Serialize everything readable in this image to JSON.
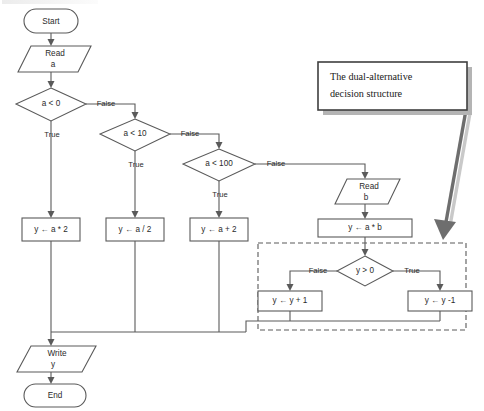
{
  "diagram": {
    "type": "flowchart",
    "title_visible": false,
    "colors": {
      "shape_stroke": "#5a5a5a",
      "shape_fill": "#ffffff",
      "text": "#2b2b2b",
      "callout_border": "#3f3f3f",
      "callout_shadow": "#b4b4b4",
      "pointer_arrow": "#6e6e6e",
      "dashed_region": "#5a5a5a"
    },
    "nodes": {
      "start": {
        "label": "Start",
        "shape": "terminator"
      },
      "read_a": {
        "label_line1": "Read",
        "label_line2": "a",
        "shape": "parallelogram"
      },
      "decision_a_lt_0": {
        "label": "a < 0",
        "shape": "diamond"
      },
      "decision_a_lt_10": {
        "label": "a < 10",
        "shape": "diamond"
      },
      "decision_a_lt_100": {
        "label": "a < 100",
        "shape": "diamond"
      },
      "read_b": {
        "label_line1": "Read",
        "label_line2": "b",
        "shape": "parallelogram"
      },
      "proc_a_times_2": {
        "label": "y ← a * 2",
        "shape": "process"
      },
      "proc_a_div_2": {
        "label": "y ← a / 2",
        "shape": "process"
      },
      "proc_a_plus_2": {
        "label": "y ← a + 2",
        "shape": "process"
      },
      "proc_a_times_b": {
        "label": "y ← a * b",
        "shape": "process"
      },
      "decision_y_gt_0": {
        "label": "y > 0",
        "shape": "diamond"
      },
      "proc_y_plus_1": {
        "label": "y ← y + 1",
        "shape": "process"
      },
      "proc_y_minus_1": {
        "label": "y ← y -1",
        "shape": "process"
      },
      "write_y": {
        "label_line1": "Write",
        "label_line2": "y",
        "shape": "parallelogram"
      },
      "end": {
        "label": "End",
        "shape": "terminator"
      }
    },
    "edge_labels": {
      "a_lt_0_true": "True",
      "a_lt_0_false": "False",
      "a_lt_10_true": "True",
      "a_lt_10_false": "False",
      "a_lt_100_true": "True",
      "a_lt_100_false": "False",
      "y_gt_0_false": "False",
      "y_gt_0_true": "True"
    },
    "callout": {
      "line1": "The dual-alternative",
      "line2": "decision structure",
      "points_to": "dashed-region"
    }
  }
}
